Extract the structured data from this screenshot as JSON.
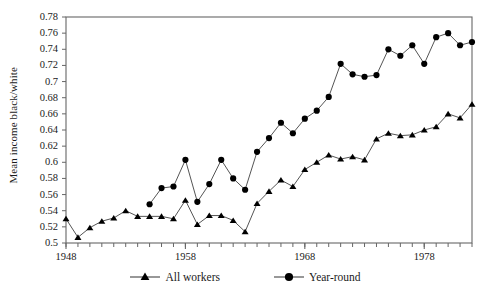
{
  "chart_data": {
    "type": "line",
    "title": "",
    "xlabel": "",
    "ylabel": "Mean income black/white",
    "xlim": [
      1948,
      1982
    ],
    "ylim": [
      0.5,
      0.78
    ],
    "ytick_step": 0.02,
    "xtick_step": 1,
    "grid": false,
    "legend_position": "below",
    "yticks": [
      "0.78",
      "0.76",
      "0.74",
      "0.72",
      "0.7",
      "0.68",
      "0.66",
      "0.64",
      "0.62",
      "0.6",
      "0.58",
      "0.56",
      "0.54",
      "0.52",
      "0.5"
    ],
    "ytick_values": [
      0.78,
      0.76,
      0.74,
      0.72,
      0.7,
      0.68,
      0.66,
      0.64,
      0.62,
      0.6,
      0.58,
      0.56,
      0.54,
      0.52,
      0.5
    ],
    "xticks": [
      "1948",
      "1958",
      "1968",
      "1978"
    ],
    "xtick_values": [
      1948,
      1958,
      1968,
      1978
    ],
    "series": [
      {
        "name": "All workers",
        "marker": "triangle",
        "x": [
          1948,
          1949,
          1950,
          1951,
          1952,
          1953,
          1954,
          1955,
          1956,
          1957,
          1958,
          1959,
          1960,
          1961,
          1962,
          1963,
          1964,
          1965,
          1966,
          1967,
          1968,
          1969,
          1970,
          1971,
          1972,
          1973,
          1974,
          1975,
          1976,
          1977,
          1978,
          1979,
          1980,
          1981,
          1982
        ],
        "values": [
          0.53,
          0.507,
          0.519,
          0.527,
          0.531,
          0.54,
          0.533,
          0.533,
          0.533,
          0.53,
          0.553,
          0.523,
          0.534,
          0.534,
          0.528,
          0.514,
          0.549,
          0.564,
          0.578,
          0.57,
          0.591,
          0.6,
          0.609,
          0.604,
          0.607,
          0.603,
          0.629,
          0.636,
          0.633,
          0.634,
          0.64,
          0.644,
          0.66,
          0.655,
          0.672
        ],
        "label_first": "1948",
        "label_last": "1982"
      },
      {
        "name": "Year-round",
        "marker": "circle",
        "x": [
          1955,
          1956,
          1957,
          1958,
          1959,
          1960,
          1961,
          1962,
          1963,
          1964,
          1965,
          1966,
          1967,
          1968,
          1969,
          1970,
          1971,
          1972,
          1973,
          1974,
          1975,
          1976,
          1977,
          1978,
          1979,
          1980,
          1981,
          1982
        ],
        "values": [
          0.548,
          0.568,
          0.57,
          0.603,
          0.551,
          0.573,
          0.603,
          0.58,
          0.566,
          0.613,
          0.63,
          0.649,
          0.636,
          0.654,
          0.664,
          0.681,
          0.722,
          0.709,
          0.706,
          0.708,
          0.74,
          0.732,
          0.745,
          0.722,
          0.755,
          0.76,
          0.745,
          0.749
        ],
        "label_first": "1955",
        "label_last": "1982"
      }
    ],
    "colors": {
      "line": "#555555",
      "marker": "#000000",
      "axis": "#666666",
      "text": "#1a1a1a"
    }
  },
  "legend": {
    "items": [
      {
        "label": "All workers",
        "marker": "triangle-marker"
      },
      {
        "label": "Year-round",
        "marker": "circle-marker"
      }
    ]
  },
  "artifacts": {
    "top_edge_text": ""
  }
}
